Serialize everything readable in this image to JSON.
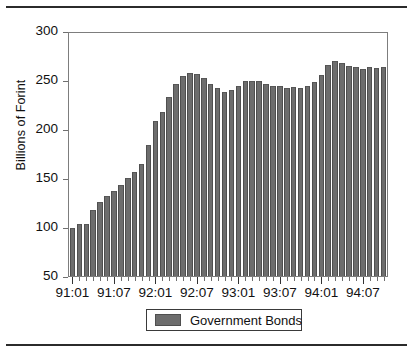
{
  "figure": {
    "top_rule": true,
    "bottom_rule": true,
    "background_color": "#ffffff",
    "axis_color": "#7d7d7d"
  },
  "legend": {
    "label": "Government Bonds",
    "swatch_color": "#6d6d6d",
    "position": "below-axis-center"
  },
  "chart_data": {
    "type": "bar",
    "title": "",
    "subtitle": "",
    "xlabel": "",
    "ylabel": "Billions of Forint",
    "ylim": [
      50,
      300
    ],
    "yticks": [
      50,
      100,
      150,
      200,
      250,
      300
    ],
    "ytick_labels": [
      "50",
      "100",
      "150",
      "200",
      "250",
      "300"
    ],
    "grid": false,
    "bar_color": "#6d6d6d",
    "legend_entries": [
      "Government Bonds"
    ],
    "legend_position": "bottom-center",
    "xtick_labels": [
      "91:01",
      "91:07",
      "92:01",
      "92:07",
      "93:01",
      "93:07",
      "94:01",
      "94:07"
    ],
    "xtick_indices": [
      0,
      6,
      12,
      18,
      24,
      30,
      36,
      42
    ],
    "categories": [
      "91:01",
      "91:02",
      "91:03",
      "91:04",
      "91:05",
      "91:06",
      "91:07",
      "91:08",
      "91:09",
      "91:10",
      "91:11",
      "91:12",
      "92:01",
      "92:02",
      "92:03",
      "92:04",
      "92:05",
      "92:06",
      "92:07",
      "92:08",
      "92:09",
      "92:10",
      "92:11",
      "92:12",
      "93:01",
      "93:02",
      "93:03",
      "93:04",
      "93:05",
      "93:06",
      "93:07",
      "93:08",
      "93:09",
      "93:10",
      "93:11",
      "93:12",
      "94:01",
      "94:02",
      "94:03",
      "94:04",
      "94:05",
      "94:06",
      "94:07",
      "94:08",
      "94:09",
      "94:10"
    ],
    "series": [
      {
        "name": "Government Bonds",
        "values": [
          99,
          103,
          103,
          118,
          126,
          132,
          137,
          144,
          151,
          157,
          165,
          185,
          209,
          219,
          234,
          248,
          256,
          259,
          258,
          254,
          248,
          243,
          239,
          241,
          245,
          251,
          251,
          251,
          248,
          246,
          245,
          243,
          244,
          243,
          245,
          250,
          257,
          267,
          271,
          269,
          266,
          265,
          263,
          265,
          264,
          265
        ]
      }
    ]
  }
}
